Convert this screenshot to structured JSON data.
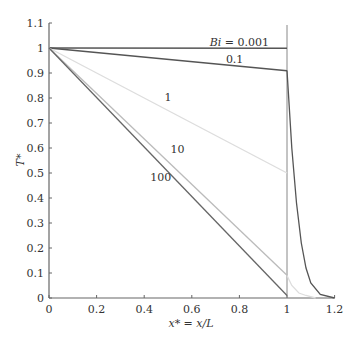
{
  "chart_data": {
    "type": "line",
    "title": "",
    "xlabel": "x* = x/L",
    "ylabel": "T*",
    "xlim": [
      0,
      1.2
    ],
    "ylim": [
      0,
      1.1
    ],
    "xticks": [
      0,
      0.2,
      0.4,
      0.6,
      0.8,
      1,
      1.2
    ],
    "xtick_labels": [
      "0",
      "0.2",
      "0.4",
      "0.6",
      "0.8",
      "1",
      "1.2"
    ],
    "yticks": [
      0,
      0.1,
      0.2,
      0.3,
      0.4,
      0.5,
      0.6,
      0.7,
      0.8,
      0.9,
      1,
      1.1
    ],
    "ytick_labels": [
      "0",
      "0.1",
      "0.2",
      "0.3",
      "0.4",
      "0.5",
      "0.6",
      "0.7",
      "0.8",
      "0.9",
      "1",
      "1.1"
    ],
    "grid": false,
    "legend": "inline labels on curves",
    "annotations": [
      {
        "text": "Bi = 0.001",
        "x": 0.8,
        "y": 1.01
      },
      {
        "text": "0.1",
        "x": 0.78,
        "y": 0.94
      },
      {
        "text": "1",
        "x": 0.5,
        "y": 0.79
      },
      {
        "text": "10",
        "x": 0.54,
        "y": 0.58
      },
      {
        "text": "100",
        "x": 0.47,
        "y": 0.47
      }
    ],
    "vertical_line": {
      "x": 1,
      "y_range": [
        0,
        1.1
      ]
    },
    "series": [
      {
        "name": "Bi = 0.001",
        "color": "#555555",
        "x": [
          0,
          1
        ],
        "y": [
          1,
          0.999
        ]
      },
      {
        "name": "Bi = 0.1",
        "color": "#555555",
        "x": [
          0,
          1
        ],
        "y": [
          1,
          0.909
        ]
      },
      {
        "name": "Bi = 1",
        "color": "#dddddd",
        "x": [
          0,
          1
        ],
        "y": [
          1,
          0.5
        ]
      },
      {
        "name": "Bi = 10",
        "color": "#bbbbbb",
        "x": [
          0,
          1
        ],
        "y": [
          1,
          0.091
        ]
      },
      {
        "name": "Bi = 100",
        "color": "#666666",
        "x": [
          0,
          1
        ],
        "y": [
          1,
          0.0099
        ]
      },
      {
        "name": "fin region (x > 1)",
        "color": "#555555",
        "x": [
          1.0,
          1.02,
          1.04,
          1.06,
          1.08,
          1.1,
          1.14,
          1.2
        ],
        "y": [
          0.91,
          0.6,
          0.38,
          0.22,
          0.12,
          0.06,
          0.015,
          0.0
        ]
      },
      {
        "name": "fin region Bi=1 (x > 1)",
        "color": "#dddddd",
        "x": [
          1.0,
          1.02,
          1.05,
          1.08,
          1.12
        ],
        "y": [
          0.09,
          0.05,
          0.02,
          0.01,
          0.0
        ]
      }
    ]
  }
}
